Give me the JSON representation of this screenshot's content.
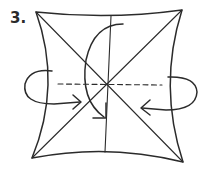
{
  "diagram": {
    "type": "origami-fold-diagram",
    "step_label": "3.",
    "colors": {
      "line": "#2b2b2b",
      "background": "#ffffff"
    },
    "elements": [
      "square-with-concave-edges",
      "diagonal-creases",
      "vertical-crease",
      "horizontal-valley-fold-dashed",
      "curved-fold-arrow-top-to-bottom",
      "left-side-fold-arrow",
      "right-side-fold-arrow"
    ]
  }
}
